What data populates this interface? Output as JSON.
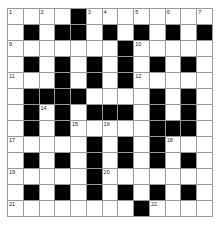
{
  "puzzle": {
    "rows": 13,
    "cols": 13,
    "colors": {
      "block": "#000000",
      "cell": "#ffffff",
      "gridline": "#9a9a9a"
    },
    "layout": [
      "....#........",
      ".#.##.#.#.#.#",
      ".......#.....",
      ".#.#.#.#.#.#.",
      "...#.#.#.....",
      ".####....#.#.",
      ".#.#.###.#.#.",
      ".#.#.....###.",
      ".....#.#.#...",
      ".#.#.#.#.#.#.",
      ".....#.......",
      ".#.#.#.#.#.#.",
      "........#...."
    ],
    "numbers": [
      {
        "r": 0,
        "c": 0,
        "n": "1"
      },
      {
        "r": 0,
        "c": 2,
        "n": "2"
      },
      {
        "r": 0,
        "c": 5,
        "n": "3"
      },
      {
        "r": 0,
        "c": 6,
        "n": "4"
      },
      {
        "r": 0,
        "c": 8,
        "n": "5"
      },
      {
        "r": 0,
        "c": 10,
        "n": "6"
      },
      {
        "r": 0,
        "c": 12,
        "n": "7"
      },
      {
        "r": 1,
        "c": 4,
        "n": "8"
      },
      {
        "r": 2,
        "c": 0,
        "n": "9"
      },
      {
        "r": 2,
        "c": 8,
        "n": "10"
      },
      {
        "r": 4,
        "c": 0,
        "n": "11"
      },
      {
        "r": 4,
        "c": 8,
        "n": "12"
      },
      {
        "r": 5,
        "c": 4,
        "n": "13"
      },
      {
        "r": 6,
        "c": 2,
        "n": "14"
      },
      {
        "r": 7,
        "c": 4,
        "n": "15"
      },
      {
        "r": 7,
        "c": 6,
        "n": "16"
      },
      {
        "r": 8,
        "c": 0,
        "n": "17"
      },
      {
        "r": 8,
        "c": 10,
        "n": "18"
      },
      {
        "r": 10,
        "c": 0,
        "n": "19"
      },
      {
        "r": 10,
        "c": 6,
        "n": "20"
      },
      {
        "r": 12,
        "c": 0,
        "n": "21"
      },
      {
        "r": 12,
        "c": 9,
        "n": "22"
      }
    ]
  }
}
